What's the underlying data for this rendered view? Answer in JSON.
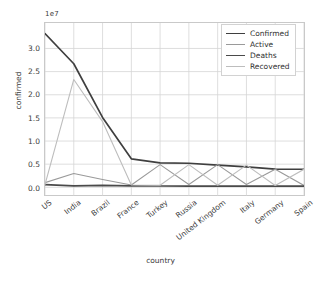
{
  "chart_data": {
    "type": "line",
    "title": "",
    "xlabel": "country",
    "ylabel": "confirmed",
    "y_offset_label": "1e7",
    "grid": true,
    "legend_position": "upper right",
    "categories": [
      "US",
      "India",
      "Brazil",
      "France",
      "Turkey",
      "Russia",
      "United Kingdom",
      "Italy",
      "Germany",
      "Spain"
    ],
    "xlim": [
      0,
      9
    ],
    "ylim": [
      -1800000.0,
      35500000.0
    ],
    "yticks": [
      0.0,
      5000000,
      10000000,
      15000000,
      20000000,
      25000000,
      30000000
    ],
    "ytick_labels": [
      "0.0",
      "0.5",
      "1.0",
      "1.5",
      "2.0",
      "2.5",
      "3.0"
    ],
    "series": [
      {
        "name": "Confirmed",
        "color": "#3f3f3f",
        "values": [
          33200000,
          26700000,
          15100000,
          6150000,
          5300000,
          5200000,
          4800000,
          4400000,
          3950000,
          3900000
        ]
      },
      {
        "name": "Active",
        "color": "#9a9a9a",
        "values": [
          1000000,
          3000000,
          1700000,
          500000,
          4900000,
          600000,
          4900000,
          600000,
          3900000,
          400000
        ]
      },
      {
        "name": "Deaths",
        "color": "#4a4a4a",
        "values": [
          600000,
          310000,
          420000,
          300000,
          280000,
          260000,
          250000,
          250000,
          240000,
          240000
        ]
      },
      {
        "name": "Recovered",
        "color": "#bdbdbd",
        "values": [
          600000,
          23300000,
          14200000,
          500000,
          450000,
          4900000,
          450000,
          4800000,
          400000,
          3900000
        ]
      }
    ]
  }
}
